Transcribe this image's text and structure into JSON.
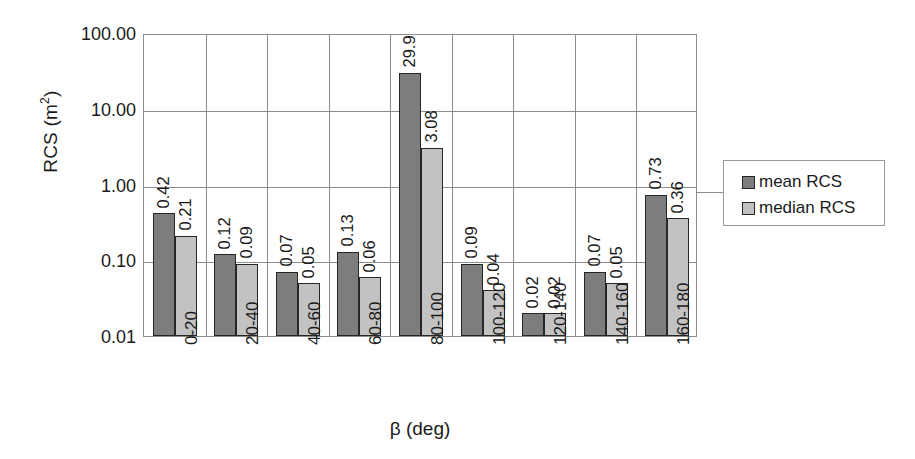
{
  "chart_data": {
    "type": "bar",
    "title": "",
    "xlabel": "β (deg)",
    "ylabel": "RCS (m²)",
    "yscale": "log",
    "ylim": [
      0.01,
      100
    ],
    "ytick_labels": [
      "100.00",
      "10.00",
      "1.00",
      "0.10",
      "0.01"
    ],
    "ytick_values": [
      100,
      10,
      1,
      0.1,
      0.01
    ],
    "grid": true,
    "legend_position": "right",
    "categories": [
      "0-20",
      "20-40",
      "40-60",
      "60-80",
      "80-100",
      "100-120",
      "120-140",
      "140-160",
      "160-180"
    ],
    "series": [
      {
        "name": "mean RCS",
        "color": "#7d7d7d",
        "values": [
          0.42,
          0.12,
          0.07,
          0.13,
          29.9,
          0.09,
          0.02,
          0.07,
          0.73
        ],
        "labels": [
          "0.42",
          "0.12",
          "0.07",
          "0.13",
          "29.9",
          "0.09",
          "0.02",
          "0.07",
          "0.73"
        ]
      },
      {
        "name": "median RCS",
        "color": "#c2c2c2",
        "values": [
          0.21,
          0.09,
          0.05,
          0.06,
          3.08,
          0.04,
          0.02,
          0.05,
          0.36
        ],
        "labels": [
          "0.21",
          "0.09",
          "0.05",
          "0.06",
          "3.08",
          "0.04",
          "0.02",
          "0.05",
          "0.36"
        ]
      }
    ]
  },
  "axes": {
    "y_title_main": "RCS (m",
    "y_title_sup": "2",
    "y_title_close": ")",
    "x_title": "β (deg)"
  },
  "legend": {
    "entries": [
      {
        "label": "mean RCS",
        "color": "#7d7d7d"
      },
      {
        "label": "median RCS",
        "color": "#c2c2c2"
      }
    ]
  },
  "style": {
    "frame_color": "#8c8c8c",
    "bar_outline": "#262626",
    "background": "#ffffff"
  }
}
